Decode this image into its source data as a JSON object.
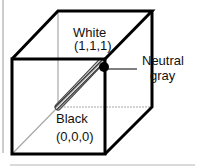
{
  "diagram": {
    "labels": {
      "white_name": "White",
      "white_coords": "(1,1,1)",
      "black_name": "Black",
      "black_coords": "(0,0,0)",
      "neutral_line1": "Neutral",
      "neutral_line2": "gray"
    },
    "colors": {
      "edge": "#000000",
      "hidden_edge": "#a8a8a8",
      "axis_hatch": "#555555",
      "frame": "#9a9a9a"
    }
  }
}
